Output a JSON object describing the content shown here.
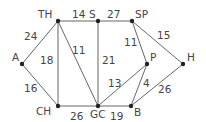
{
  "diagram": {
    "type": "weighted-graph",
    "nodes": [
      {
        "id": "TH",
        "label": "TH",
        "x": 58,
        "y": 21,
        "lx": 38,
        "ly": 18
      },
      {
        "id": "S",
        "label": "S",
        "x": 98,
        "y": 21,
        "lx": 89,
        "ly": 18
      },
      {
        "id": "SP",
        "label": "SP",
        "x": 132,
        "y": 21,
        "lx": 135,
        "ly": 18
      },
      {
        "id": "A",
        "label": "A",
        "x": 22,
        "y": 64,
        "lx": 12,
        "ly": 61
      },
      {
        "id": "P",
        "label": "P",
        "x": 147,
        "y": 64,
        "lx": 150,
        "ly": 61
      },
      {
        "id": "H",
        "label": "H",
        "x": 183,
        "y": 64,
        "lx": 187,
        "ly": 61
      },
      {
        "id": "CH",
        "label": "CH",
        "x": 58,
        "y": 106,
        "lx": 36,
        "ly": 115
      },
      {
        "id": "GC",
        "label": "GC",
        "x": 98,
        "y": 106,
        "lx": 90,
        "ly": 118
      },
      {
        "id": "B",
        "label": "B",
        "x": 131,
        "y": 106,
        "lx": 134,
        "ly": 116
      }
    ],
    "edges": [
      {
        "from": "TH",
        "to": "S",
        "weight": "14",
        "wx": 72,
        "wy": 18
      },
      {
        "from": "S",
        "to": "SP",
        "weight": "27",
        "wx": 107,
        "wy": 18
      },
      {
        "from": "A",
        "to": "TH",
        "weight": "24",
        "wx": 24,
        "wy": 40
      },
      {
        "from": "TH",
        "to": "CH",
        "weight": "18",
        "wx": 40,
        "wy": 64
      },
      {
        "from": "TH",
        "to": "GC",
        "weight": "11",
        "wx": 72,
        "wy": 54
      },
      {
        "from": "S",
        "to": "GC",
        "weight": "21",
        "wx": 102,
        "wy": 64
      },
      {
        "from": "SP",
        "to": "P",
        "weight": "11",
        "wx": 124,
        "wy": 46
      },
      {
        "from": "SP",
        "to": "H",
        "weight": "15",
        "wx": 157,
        "wy": 39
      },
      {
        "from": "A",
        "to": "CH",
        "weight": "16",
        "wx": 24,
        "wy": 92
      },
      {
        "from": "CH",
        "to": "GC",
        "weight": "26",
        "wx": 70,
        "wy": 120
      },
      {
        "from": "GC",
        "to": "B",
        "weight": "19",
        "wx": 110,
        "wy": 120
      },
      {
        "from": "GC",
        "to": "P",
        "weight": "13",
        "wx": 108,
        "wy": 87
      },
      {
        "from": "P",
        "to": "B",
        "weight": "4",
        "wx": 143,
        "wy": 87
      },
      {
        "from": "H",
        "to": "B",
        "weight": "26",
        "wx": 158,
        "wy": 93
      }
    ]
  }
}
